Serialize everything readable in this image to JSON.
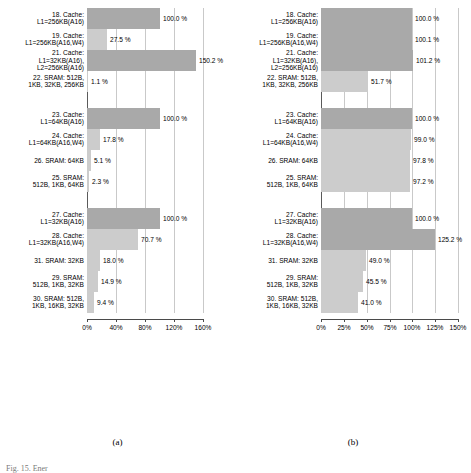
{
  "figure": {
    "panel_a_caption": "(a)",
    "panel_b_caption": "(b)",
    "bottom_caption": "Fig. 15. Ener"
  },
  "colors": {
    "bar_reference": "#a9a9a9",
    "bar_alternate": "#cccccc",
    "gridline": "#c9c9c9",
    "axis": "#4a4a4a"
  },
  "chart_data": [
    {
      "type": "bar",
      "orientation": "horizontal",
      "title": "(a)",
      "xlabel": "",
      "ylabel": "",
      "xlim": [
        0,
        160
      ],
      "xticks": [
        0,
        40,
        80,
        120,
        160
      ],
      "xticklabels": [
        "0%",
        "40%",
        "80%",
        "120%",
        "160%"
      ],
      "grid": true,
      "unit": "%",
      "groups": [
        {
          "bars": [
            {
              "label_lines": [
                "18. Cache:",
                "L1=256KB(A16)"
              ],
              "value": 100.0,
              "value_label": "100.0 %",
              "style": "reference"
            },
            {
              "label_lines": [
                "19. Cache:",
                "L1=256KB(A16,W4)"
              ],
              "value": 27.5,
              "value_label": "27.5 %",
              "style": "alternate"
            },
            {
              "label_lines": [
                "21. Cache:",
                "L1=32KB(A16),",
                "L2=256KB(A16)"
              ],
              "value": 150.2,
              "value_label": "150.2 %",
              "style": "reference"
            },
            {
              "label_lines": [
                "22. SRAM: 512B,",
                "1KB, 32KB, 256KB"
              ],
              "value": 1.1,
              "value_label": "1.1 %",
              "style": "alternate"
            }
          ]
        },
        {
          "bars": [
            {
              "label_lines": [
                "23. Cache:",
                "L1=64KB(A16)"
              ],
              "value": 100.0,
              "value_label": "100.0 %",
              "style": "reference"
            },
            {
              "label_lines": [
                "24. Cache:",
                "L1=64KB(A16,W4)"
              ],
              "value": 17.8,
              "value_label": "17.8 %",
              "style": "alternate"
            },
            {
              "label_lines": [
                "26. SRAM: 64KB"
              ],
              "value": 5.1,
              "value_label": "5.1 %",
              "style": "alternate"
            },
            {
              "label_lines": [
                "25. SRAM:",
                "512B, 1KB, 64KB"
              ],
              "value": 2.3,
              "value_label": "2.3 %",
              "style": "alternate"
            }
          ]
        },
        {
          "bars": [
            {
              "label_lines": [
                "27. Cache:",
                "L1=32KB(A16)"
              ],
              "value": 100.0,
              "value_label": "100.0 %",
              "style": "reference"
            },
            {
              "label_lines": [
                "28. Cache:",
                "L1=32KB(A16,W4)"
              ],
              "value": 70.7,
              "value_label": "70.7 %",
              "style": "alternate"
            },
            {
              "label_lines": [
                "31. SRAM: 32KB"
              ],
              "value": 18.0,
              "value_label": "18.0 %",
              "style": "alternate"
            },
            {
              "label_lines": [
                "29. SRAM:",
                "512B, 1KB, 32KB"
              ],
              "value": 14.9,
              "value_label": "14.9 %",
              "style": "alternate"
            },
            {
              "label_lines": [
                "30. SRAM: 512B,",
                "1KB, 16KB, 32KB"
              ],
              "value": 9.4,
              "value_label": "9.4 %",
              "style": "alternate"
            }
          ]
        }
      ]
    },
    {
      "type": "bar",
      "orientation": "horizontal",
      "title": "(b)",
      "xlabel": "",
      "ylabel": "",
      "xlim": [
        0,
        150
      ],
      "xticks": [
        0,
        25,
        50,
        75,
        100,
        125,
        150
      ],
      "xticklabels": [
        "0%",
        "25%",
        "50%",
        "75%",
        "100%",
        "125%",
        "150%"
      ],
      "grid": true,
      "unit": "%",
      "groups": [
        {
          "bars": [
            {
              "label_lines": [
                "18. Cache:",
                "L1=256KB(A16)"
              ],
              "value": 100.0,
              "value_label": "100.0 %",
              "style": "reference"
            },
            {
              "label_lines": [
                "19. Cache:",
                "L1=256KB(A16,W4)"
              ],
              "value": 100.1,
              "value_label": "100.1 %",
              "style": "reference"
            },
            {
              "label_lines": [
                "21. Cache:",
                "L1=32KB(A16),",
                "L2=256KB(A16)"
              ],
              "value": 101.2,
              "value_label": "101.2 %",
              "style": "reference"
            },
            {
              "label_lines": [
                "22. SRAM: 512B,",
                "1KB, 32KB, 256KB"
              ],
              "value": 51.7,
              "value_label": "51.7 %",
              "style": "alternate"
            }
          ]
        },
        {
          "bars": [
            {
              "label_lines": [
                "23. Cache:",
                "L1=64KB(A16)"
              ],
              "value": 100.0,
              "value_label": "100.0 %",
              "style": "reference"
            },
            {
              "label_lines": [
                "24. Cache:",
                "L1=64KB(A16,W4)"
              ],
              "value": 99.0,
              "value_label": "99.0 %",
              "style": "alternate"
            },
            {
              "label_lines": [
                "26. SRAM: 64KB"
              ],
              "value": 97.8,
              "value_label": "97.8 %",
              "style": "alternate"
            },
            {
              "label_lines": [
                "25. SRAM:",
                "512B, 1KB, 64KB"
              ],
              "value": 97.2,
              "value_label": "97.2 %",
              "style": "alternate"
            }
          ]
        },
        {
          "bars": [
            {
              "label_lines": [
                "27. Cache:",
                "L1=32KB(A16)"
              ],
              "value": 100.0,
              "value_label": "100.0 %",
              "style": "reference"
            },
            {
              "label_lines": [
                "28. Cache:",
                "L1=32KB(A16,W4)"
              ],
              "value": 125.2,
              "value_label": "125.2 %",
              "style": "reference"
            },
            {
              "label_lines": [
                "31. SRAM: 32KB"
              ],
              "value": 49.0,
              "value_label": "49.0 %",
              "style": "alternate"
            },
            {
              "label_lines": [
                "29. SRAM:",
                "512B, 1KB, 32KB"
              ],
              "value": 45.5,
              "value_label": "45.5 %",
              "style": "alternate"
            },
            {
              "label_lines": [
                "30. SRAM: 512B,",
                "1KB, 16KB, 32KB"
              ],
              "value": 41.0,
              "value_label": "41.0 %",
              "style": "alternate"
            }
          ]
        }
      ]
    }
  ]
}
